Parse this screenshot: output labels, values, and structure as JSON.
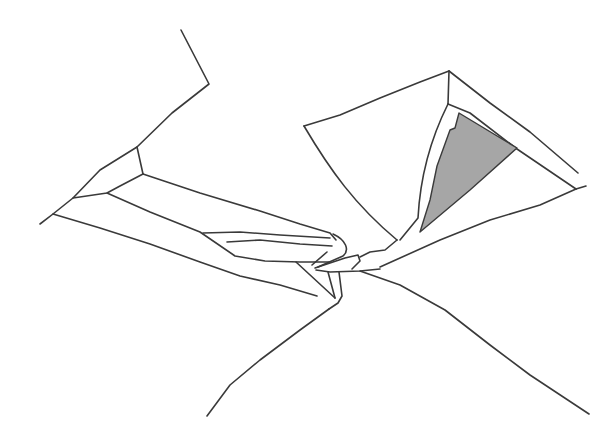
{
  "figure": {
    "kind": "line-drawing illustration",
    "stroke_color": "#3a3a3a",
    "fill_color": "#a6a6a6",
    "background": "#ffffff"
  }
}
